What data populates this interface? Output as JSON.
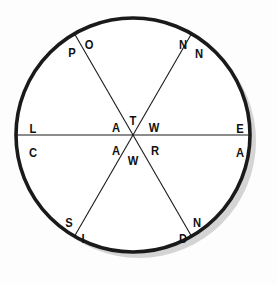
{
  "figure": {
    "background_color": "#fdfdfd",
    "circle": {
      "stroke_color": "#1a1a1a",
      "fill_color": "#ffffff",
      "shadow_color": "#cccccc",
      "center_x": 133,
      "center_y": 135,
      "radius": 117,
      "stroke_width": 3.6
    },
    "diameters": {
      "count": 3,
      "stroke_color": "#1a1a1a",
      "stroke_width": 1.1,
      "angles_deg": [
        0,
        60,
        120
      ]
    }
  },
  "labels": [
    {
      "id": "label-p",
      "text": "P",
      "x": 72,
      "y": 52,
      "region": "top-left-outer"
    },
    {
      "id": "label-o",
      "text": "O",
      "x": 89,
      "y": 44,
      "region": "top-left-inner"
    },
    {
      "id": "label-n1",
      "text": "N",
      "x": 183,
      "y": 44,
      "region": "top-right-inner"
    },
    {
      "id": "label-n2",
      "text": "N",
      "x": 199,
      "y": 53,
      "region": "top-right-outer"
    },
    {
      "id": "label-l",
      "text": "L",
      "x": 33,
      "y": 128,
      "region": "left-upper"
    },
    {
      "id": "label-c",
      "text": "C",
      "x": 33,
      "y": 152,
      "region": "left-lower"
    },
    {
      "id": "label-e",
      "text": "E",
      "x": 240,
      "y": 128,
      "region": "right-upper"
    },
    {
      "id": "label-a3",
      "text": "A",
      "x": 240,
      "y": 152,
      "region": "right-lower"
    },
    {
      "id": "label-a1",
      "text": "A",
      "x": 116,
      "y": 127,
      "region": "center-upper-left"
    },
    {
      "id": "label-t",
      "text": "T",
      "x": 133,
      "y": 120,
      "region": "center-top"
    },
    {
      "id": "label-w1",
      "text": "W",
      "x": 154,
      "y": 127,
      "region": "center-upper-right"
    },
    {
      "id": "label-a2",
      "text": "A",
      "x": 116,
      "y": 150,
      "region": "center-lower-left"
    },
    {
      "id": "label-w2",
      "text": "W",
      "x": 133,
      "y": 160,
      "region": "center-bottom"
    },
    {
      "id": "label-r",
      "text": "R",
      "x": 155,
      "y": 150,
      "region": "center-lower-right"
    },
    {
      "id": "label-s",
      "text": "S",
      "x": 69,
      "y": 222,
      "region": "bottom-left-outer"
    },
    {
      "id": "label-i",
      "text": "I",
      "x": 83,
      "y": 238,
      "region": "bottom-left-inner"
    },
    {
      "id": "label-d",
      "text": "D",
      "x": 183,
      "y": 238,
      "region": "bottom-right-outer"
    },
    {
      "id": "label-n3",
      "text": "N",
      "x": 197,
      "y": 222,
      "region": "bottom-right-inner"
    }
  ]
}
